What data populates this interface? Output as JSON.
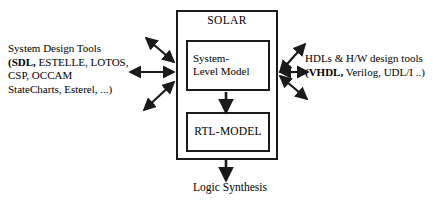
{
  "diagram": {
    "background_color": "#ffffff",
    "stroke_color": "#1a1a1a",
    "outer_box": {
      "label": "SOLAR"
    },
    "inner_boxes": [
      {
        "id": "system-level-model",
        "line1": "System-",
        "line2": "Level Model"
      },
      {
        "id": "rtl-model",
        "label": "RTL-MODEL"
      }
    ],
    "left_annotation": {
      "line1": "System Design Tools",
      "line2_bold": "(SDL,",
      "line2_rest": " ESTELLE, LOTOS,",
      "line3": "CSP, OCCAM",
      "line4": "StateCharts, Esterel, ...)"
    },
    "right_annotation": {
      "line1": "HDLs & H/W design tools",
      "line2_bold": "(VHDL,",
      "line2_rest": " Verilog, UDL/I ..)"
    },
    "bottom_annotation": {
      "label": "Logic Synthesis"
    },
    "connections": [
      {
        "id": "left-upper",
        "style": "double-headed",
        "direction": "diagonal-up-left"
      },
      {
        "id": "left-middle",
        "style": "double-headed",
        "direction": "horizontal-left"
      },
      {
        "id": "left-lower",
        "style": "double-headed",
        "direction": "diagonal-down-left"
      },
      {
        "id": "right-upper",
        "style": "double-headed",
        "direction": "diagonal-up-right"
      },
      {
        "id": "right-middle",
        "style": "double-headed",
        "direction": "horizontal-right"
      },
      {
        "id": "right-lower",
        "style": "double-headed",
        "direction": "diagonal-down-right"
      },
      {
        "id": "sys-to-rtl",
        "style": "single-headed",
        "direction": "down"
      },
      {
        "id": "rtl-to-logic-synthesis",
        "style": "single-headed",
        "direction": "down"
      }
    ]
  }
}
